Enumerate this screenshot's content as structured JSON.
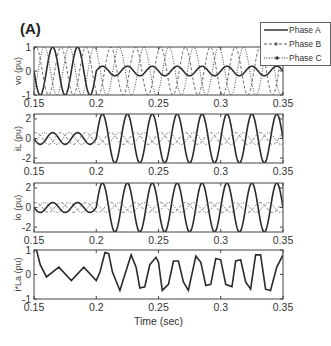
{
  "figure": {
    "panel_label": "(A)",
    "xlabel": "Time (sec)"
  },
  "legend": {
    "items": [
      {
        "label": "Phase A",
        "style": "solid"
      },
      {
        "label": "Phase B",
        "style": "dashed"
      },
      {
        "label": "Phase C",
        "style": "dotted"
      }
    ]
  },
  "chart_data": [
    {
      "type": "line",
      "title": "",
      "xlabel": "",
      "ylabel": "vo (pu)",
      "xlim": [
        0.15,
        0.35
      ],
      "ylim": [
        -1,
        1
      ],
      "xticks": [
        0.15,
        0.2,
        0.25,
        0.3,
        0.35
      ],
      "xtick_labels": [
        "0.15",
        "0.2",
        "0.25",
        "0.3",
        "0.35"
      ],
      "yticks": [
        -1,
        0,
        1
      ],
      "ytick_labels": [
        "-1",
        "0",
        "1"
      ],
      "frequency_hz": 50,
      "series": [
        {
          "name": "Phase A",
          "description": "sinusoid amplitude ~1 until t=0.2, then reduced to ~0.2",
          "amplitude_before": 1.0,
          "amplitude_after": 0.2,
          "phase_deg": 0
        },
        {
          "name": "Phase B",
          "description": "sinusoid amplitude ~1 throughout",
          "amplitude_before": 1.0,
          "amplitude_after": 1.0,
          "phase_deg": -120
        },
        {
          "name": "Phase C",
          "description": "sinusoid amplitude ~1 throughout",
          "amplitude_before": 1.0,
          "amplitude_after": 1.0,
          "phase_deg": 120
        }
      ]
    },
    {
      "type": "line",
      "title": "",
      "xlabel": "",
      "ylabel": "iL (pu)",
      "xlim": [
        0.15,
        0.35
      ],
      "ylim": [
        -2.5,
        2.5
      ],
      "xticks": [
        0.15,
        0.2,
        0.25,
        0.3,
        0.35
      ],
      "xtick_labels": [
        "0.15",
        "0.2",
        "0.25",
        "0.3",
        "0.35"
      ],
      "yticks": [
        -2,
        0,
        2
      ],
      "ytick_labels": [
        "-2",
        "0",
        "2"
      ],
      "frequency_hz": 50,
      "series": [
        {
          "name": "Phase A",
          "amplitude_before": 0.6,
          "amplitude_after": 2.5,
          "phase_deg": 0
        },
        {
          "name": "Phase B",
          "amplitude_before": 0.6,
          "amplitude_after": 0.6,
          "phase_deg": -120
        },
        {
          "name": "Phase C",
          "amplitude_before": 0.6,
          "amplitude_after": 0.6,
          "phase_deg": 120
        }
      ]
    },
    {
      "type": "line",
      "title": "",
      "xlabel": "",
      "ylabel": "io (pu)",
      "xlim": [
        0.15,
        0.35
      ],
      "ylim": [
        -2.5,
        2.5
      ],
      "xticks": [
        0.15,
        0.2,
        0.25,
        0.3,
        0.35
      ],
      "xtick_labels": [
        "0.15",
        "0.2",
        "0.25",
        "0.3",
        "0.35"
      ],
      "yticks": [
        -2,
        0,
        2
      ],
      "ytick_labels": [
        "-2",
        "0",
        "2"
      ],
      "frequency_hz": 50,
      "series": [
        {
          "name": "Phase A",
          "amplitude_before": 0.5,
          "amplitude_after": 2.5,
          "phase_deg": 0
        },
        {
          "name": "Phase B",
          "amplitude_before": 0.5,
          "amplitude_after": 0.5,
          "phase_deg": -120
        },
        {
          "name": "Phase C",
          "amplitude_before": 0.5,
          "amplitude_after": 0.5,
          "phase_deg": 120
        }
      ]
    },
    {
      "type": "line",
      "title": "",
      "xlabel": "Time (sec)",
      "ylabel": "i*La (pu)",
      "xlim": [
        0.15,
        0.35
      ],
      "ylim": [
        -1,
        1
      ],
      "xticks": [
        0.15,
        0.2,
        0.25,
        0.3,
        0.35
      ],
      "xtick_labels": [
        "0.15",
        "0.2",
        "0.25",
        "0.3",
        "0.35"
      ],
      "yticks": [
        -1,
        0,
        1
      ],
      "ytick_labels": [
        "-1",
        "0",
        "1"
      ],
      "series": [
        {
          "name": "Phase A",
          "x": [
            0.15,
            0.152,
            0.155,
            0.16,
            0.17,
            0.18,
            0.19,
            0.2,
            0.203,
            0.207,
            0.21,
            0.213,
            0.219,
            0.223,
            0.228,
            0.232,
            0.235,
            0.239,
            0.243,
            0.248,
            0.25,
            0.253,
            0.258,
            0.262,
            0.266,
            0.27,
            0.274,
            0.28,
            0.284,
            0.288,
            0.292,
            0.296,
            0.3,
            0.304,
            0.309,
            0.312,
            0.316,
            0.32,
            0.324,
            0.328,
            0.332,
            0.336,
            0.34,
            0.345,
            0.35
          ],
          "y": [
            1.0,
            1.0,
            0.4,
            -0.1,
            0.3,
            -0.25,
            0.3,
            -0.25,
            0.1,
            0.9,
            0.85,
            0.1,
            -0.65,
            0.0,
            0.8,
            0.3,
            -0.55,
            -0.5,
            0.4,
            0.7,
            0.5,
            -0.65,
            -0.4,
            0.55,
            0.55,
            -0.3,
            -0.65,
            0.75,
            0.5,
            -0.45,
            -0.4,
            0.65,
            0.6,
            -0.4,
            -0.5,
            0.55,
            0.6,
            -0.3,
            -0.6,
            0.8,
            0.8,
            -0.6,
            -0.65,
            0.3,
            0.8
          ]
        }
      ]
    }
  ]
}
